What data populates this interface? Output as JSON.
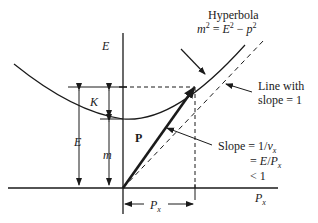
{
  "figure": {
    "hyperbola_title": "Hyperbola",
    "hyperbola_equation": {
      "lhs": "m",
      "lhs_exp": "2",
      "eq": " = ",
      "e": "E",
      "e_exp": "2",
      "minus": " − ",
      "p": "p",
      "p_exp": "2"
    },
    "axis_y_label": "E",
    "axis_x_label": "P",
    "axis_x_sub": "x",
    "label_K": "K",
    "label_E": "E",
    "label_m": "m",
    "label_P": "P",
    "px_label": "P",
    "px_sub": "x",
    "line_note": [
      "Line with",
      "slope = 1"
    ],
    "slope_note": {
      "line1_a": "Slope = 1/",
      "line1_v": "v",
      "line1_sub": "x",
      "line2_a": "= ",
      "line2_b": "E",
      "line2_c": "/",
      "line2_d": "P",
      "line2_sub": "x",
      "line3": "< 1"
    }
  },
  "colors": {
    "ink": "#1a1a1a",
    "background": "#ffffff"
  }
}
